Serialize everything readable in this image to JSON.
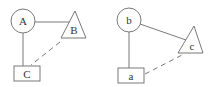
{
  "diagrams": [
    {
      "nodes": {
        "circle": {
          "label": "A",
          "shape": "circle"
        },
        "triangle": {
          "label": "B",
          "shape": "triangle"
        },
        "box": {
          "label": "C",
          "shape": "rectangle"
        }
      },
      "edges": [
        {
          "from": "A",
          "to": "B",
          "style": "solid"
        },
        {
          "from": "A",
          "to": "C",
          "style": "solid"
        },
        {
          "from": "B",
          "to": "C",
          "style": "dashed"
        }
      ]
    },
    {
      "nodes": {
        "circle": {
          "label": "b",
          "shape": "circle"
        },
        "triangle": {
          "label": "c",
          "shape": "triangle"
        },
        "box": {
          "label": "a",
          "shape": "rectangle"
        }
      },
      "edges": [
        {
          "from": "b",
          "to": "c",
          "style": "solid"
        },
        {
          "from": "b",
          "to": "a",
          "style": "solid"
        },
        {
          "from": "c",
          "to": "a",
          "style": "dashed"
        }
      ]
    }
  ]
}
